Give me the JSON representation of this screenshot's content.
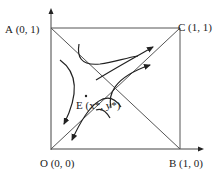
{
  "diagram": {
    "type": "phase-portrait",
    "points": {
      "A": {
        "label": "A (0, 1)"
      },
      "C": {
        "label": "C (1, 1)"
      },
      "O": {
        "label": "O (0, 0)"
      },
      "B": {
        "label": "B (1, 0)"
      },
      "E": {
        "label": "E (x*, y*)"
      }
    },
    "colors": {
      "line": "#555555",
      "curve": "#222222",
      "text": "#222222"
    }
  }
}
